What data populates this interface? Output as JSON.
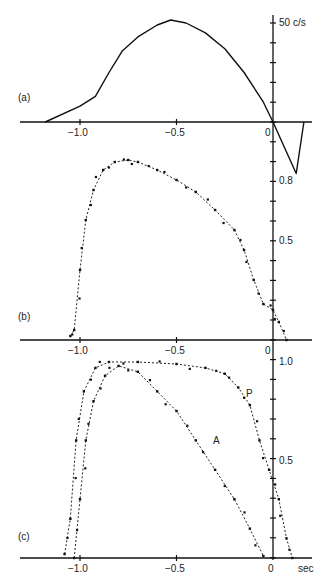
{
  "chart_data": [
    {
      "panel": "(a)",
      "type": "line",
      "title": "",
      "xlabel": "",
      "ylabel": "c/s",
      "y_tick_label": "50 c/s",
      "x_ticks": [
        "-1.0",
        "-0.5",
        "0"
      ],
      "xlim": [
        -1.25,
        0.22
      ],
      "ylim": [
        -30,
        55
      ],
      "series": [
        {
          "name": "frequency",
          "style": "solid",
          "x": [
            -1.18,
            -1.0,
            -0.92,
            -0.85,
            -0.78,
            -0.7,
            -0.6,
            -0.53,
            -0.45,
            -0.35,
            -0.25,
            -0.15,
            -0.05,
            0.0,
            0.12,
            0.16
          ],
          "y": [
            0,
            8,
            13,
            25,
            36,
            43,
            49,
            51.5,
            50,
            45,
            37,
            25,
            10,
            0,
            -26,
            0
          ]
        }
      ]
    },
    {
      "panel": "(b)",
      "type": "scatter",
      "xlabel": "",
      "ylabel": "",
      "x_ticks": [
        "-1.0",
        "-0.5",
        "0"
      ],
      "y_ticks": [
        "0.5",
        "0.8"
      ],
      "xlim": [
        -1.25,
        0.22
      ],
      "ylim": [
        0,
        0.95
      ],
      "series": [
        {
          "name": "b",
          "style": "dotted-with-points",
          "x": [
            -1.05,
            -1.03,
            -1.0,
            -0.97,
            -0.93,
            -0.88,
            -0.82,
            -0.75,
            -0.7,
            -0.6,
            -0.5,
            -0.4,
            -0.3,
            -0.2,
            -0.15,
            -0.1,
            -0.05,
            0.0,
            0.03,
            0.07
          ],
          "y": [
            0.02,
            0.05,
            0.35,
            0.6,
            0.75,
            0.85,
            0.89,
            0.9,
            0.89,
            0.85,
            0.8,
            0.74,
            0.65,
            0.55,
            0.45,
            0.3,
            0.18,
            0.15,
            0.09,
            0.0
          ]
        }
      ]
    },
    {
      "panel": "(c)",
      "type": "scatter",
      "xlabel": "sec",
      "ylabel": "",
      "x_ticks": [
        "-1.0",
        "-0.5",
        "0"
      ],
      "y_ticks": [
        "0.5",
        "1.0"
      ],
      "xlim": [
        -1.25,
        0.22
      ],
      "ylim": [
        0,
        1.05
      ],
      "series": [
        {
          "name": "P",
          "style": "dotted-with-points",
          "x": [
            -1.08,
            -1.05,
            -1.02,
            -0.98,
            -0.92,
            -0.85,
            -0.7,
            -0.5,
            -0.35,
            -0.25,
            -0.18,
            -0.12,
            -0.07,
            -0.02,
            0.03,
            0.07,
            0.1
          ],
          "y": [
            0.02,
            0.2,
            0.6,
            0.85,
            0.97,
            1.0,
            1.0,
            0.99,
            0.97,
            0.94,
            0.87,
            0.78,
            0.6,
            0.45,
            0.3,
            0.1,
            0.0
          ]
        },
        {
          "name": "A",
          "style": "dotted-with-points",
          "x": [
            -1.03,
            -1.0,
            -0.97,
            -0.93,
            -0.87,
            -0.8,
            -0.7,
            -0.6,
            -0.5,
            -0.4,
            -0.3,
            -0.2,
            -0.12,
            -0.05
          ],
          "y": [
            0.0,
            0.3,
            0.6,
            0.8,
            0.93,
            0.98,
            0.95,
            0.85,
            0.75,
            0.6,
            0.45,
            0.3,
            0.15,
            0.01
          ]
        }
      ]
    }
  ],
  "labels": {
    "panel_a": "(a)",
    "panel_b": "(b)",
    "panel_c": "(c)",
    "a_ytick": "50 c/s",
    "b_ytick_hi": "0.8",
    "b_ytick_mid": "0.5",
    "c_ytick_hi": "1.0",
    "c_ytick_mid": "0.5",
    "xtick_m10": "−1.0",
    "xtick_m05": "−0.5",
    "xtick_0": "0",
    "x_unit": "sec",
    "series_P": "P",
    "series_A": "A"
  }
}
